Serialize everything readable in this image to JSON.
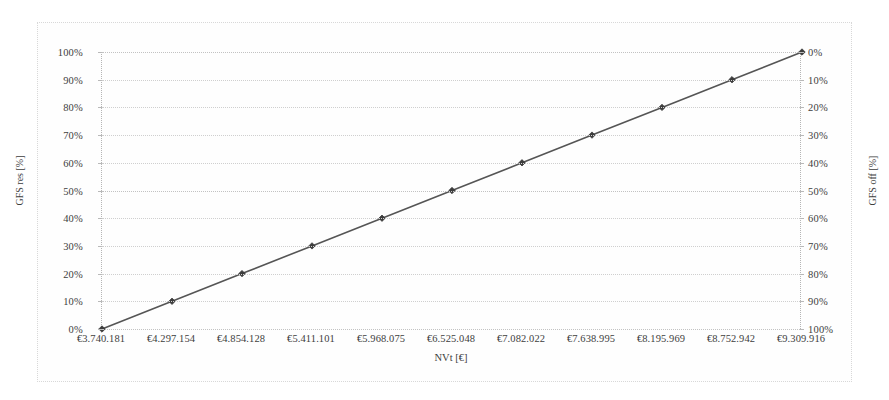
{
  "chart_data": {
    "type": "line",
    "title": "",
    "xlabel": "NVt [€]",
    "ylabel": "GFS res [%]",
    "ylabel_right": "GFS off [%]",
    "categories": [
      "€3.740.181",
      "€4.297.154",
      "€4.854.128",
      "€5.411.101",
      "€5.968.075",
      "€6.525.048",
      "€7.082.022",
      "€7.638.995",
      "€8.195.969",
      "€8.752.942",
      "€9.309.916"
    ],
    "x": [
      3740181,
      4297154,
      4854128,
      5411101,
      5968075,
      6525048,
      7082022,
      7638995,
      8195969,
      8752942,
      9309916
    ],
    "series": [
      {
        "name": "GFS res",
        "values": [
          0,
          10,
          20,
          30,
          40,
          50,
          60,
          70,
          80,
          90,
          100
        ]
      },
      {
        "name": "GFS off",
        "values": [
          100,
          90,
          80,
          70,
          60,
          50,
          40,
          30,
          20,
          10,
          0
        ]
      }
    ],
    "ylim": [
      0,
      100
    ],
    "ylim_right": [
      0,
      100
    ],
    "y_ticks_left": [
      "0%",
      "10%",
      "20%",
      "30%",
      "40%",
      "50%",
      "60%",
      "70%",
      "80%",
      "90%",
      "100%"
    ],
    "y_ticks_right": [
      "0%",
      "10%",
      "20%",
      "30%",
      "40%",
      "50%",
      "60%",
      "70%",
      "80%",
      "90%",
      "100%"
    ],
    "grid": true,
    "legend": "none",
    "line_color": "#555555",
    "marker_color": "#3c3c3c",
    "marker_shape": "diamond",
    "grid_color": "#cfcfcf",
    "frame_color": "#d8d8d8",
    "background": "#ffffff"
  }
}
